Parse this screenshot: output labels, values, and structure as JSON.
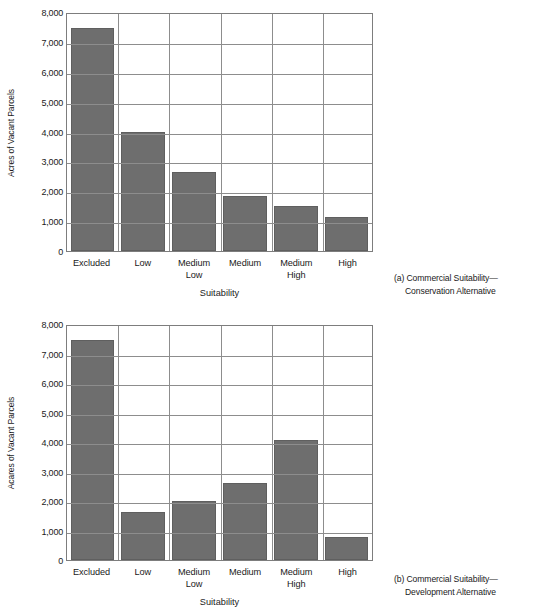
{
  "figure": {
    "panels": [
      {
        "id": "a",
        "caption_line1": "(a) Commercial Suitability—",
        "caption_line2": "Conservation Alternative"
      },
      {
        "id": "b",
        "caption_line1": "(b) Commercial Suitability—",
        "caption_line2": "Development Alternative"
      }
    ]
  },
  "chart_data": [
    {
      "type": "bar",
      "panel": "a",
      "title": "",
      "ylabel": "Acres of Vacant Parcels",
      "xlabel": "Suitability",
      "categories": [
        "Excluded",
        "Low",
        "Medium Low",
        "Medium",
        "Medium High",
        "High"
      ],
      "category_lines": [
        [
          "Excluded",
          ""
        ],
        [
          "Low",
          ""
        ],
        [
          "Medium",
          "Low"
        ],
        [
          "Medium",
          ""
        ],
        [
          "Medium",
          "High"
        ],
        [
          "High",
          ""
        ]
      ],
      "values": [
        7450,
        4000,
        2630,
        1830,
        1520,
        1130
      ],
      "ylim": [
        0,
        8000
      ],
      "yticks": [
        0,
        1000,
        2000,
        3000,
        4000,
        5000,
        6000,
        7000,
        8000
      ],
      "ytick_labels": [
        "0",
        "1,000",
        "2,000",
        "3,000",
        "4,000",
        "5,000",
        "6,000",
        "7,000",
        "8,000"
      ],
      "grid": true,
      "legend": "none",
      "bar_color": "#6e6e6e"
    },
    {
      "type": "bar",
      "panel": "b",
      "title": "",
      "ylabel": "Acares of Vacant Parcels",
      "xlabel": "Suitability",
      "categories": [
        "Excluded",
        "Low",
        "Medium Low",
        "Medium",
        "Medium High",
        "High"
      ],
      "category_lines": [
        [
          "Excluded",
          ""
        ],
        [
          "Low",
          ""
        ],
        [
          "Medium",
          "Low"
        ],
        [
          "Medium",
          ""
        ],
        [
          "Medium",
          "High"
        ],
        [
          "High",
          ""
        ]
      ],
      "values": [
        7450,
        1620,
        2000,
        2600,
        4070,
        770
      ],
      "ylim": [
        0,
        8000
      ],
      "yticks": [
        0,
        1000,
        2000,
        3000,
        4000,
        5000,
        6000,
        7000,
        8000
      ],
      "ytick_labels": [
        "0",
        "1,000",
        "2,000",
        "3,000",
        "4,000",
        "5,000",
        "6,000",
        "7,000",
        "8,000"
      ],
      "grid": true,
      "legend": "none",
      "bar_color": "#6e6e6e"
    }
  ]
}
